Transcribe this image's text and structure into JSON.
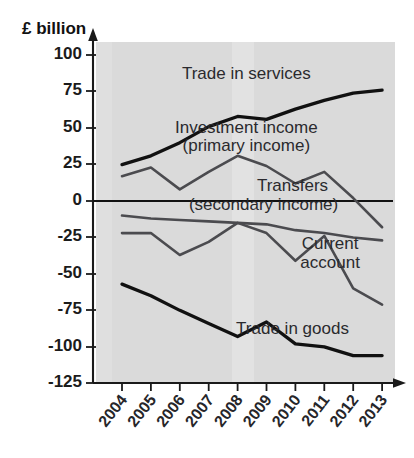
{
  "chart_data": {
    "type": "line",
    "title": "",
    "xlabel": "",
    "ylabel": "£ billion",
    "ylim": [
      -125,
      100
    ],
    "grid": false,
    "legend_position": "inline-annotations",
    "categories": [
      "2004",
      "2005",
      "2006",
      "2007",
      "2008",
      "2009",
      "2010",
      "2011",
      "2012",
      "2013"
    ],
    "yticks": [
      "100",
      "75",
      "50",
      "25",
      "0",
      "-25",
      "-50",
      "-75",
      "-100",
      "-125"
    ],
    "ytick_values": [
      100,
      75,
      50,
      25,
      0,
      -25,
      -50,
      -75,
      -100,
      -125
    ],
    "series": [
      {
        "name": "Trade in services",
        "style": "thick-black",
        "color": "#111111",
        "values": [
          25,
          31,
          40,
          51,
          58,
          56,
          63,
          69,
          74,
          76
        ]
      },
      {
        "name": "Investment income (primary income)",
        "style": "thin-grey",
        "color": "#4b4b4f",
        "values": [
          17,
          23,
          8,
          20,
          31,
          24,
          12,
          20,
          2,
          -18
        ]
      },
      {
        "name": "Transfers (secondary income)",
        "style": "thin-grey",
        "color": "#4b4b4f",
        "values": [
          -10,
          -12,
          -13,
          -14,
          -15,
          -16,
          -20,
          -22,
          -25,
          -27
        ]
      },
      {
        "name": "Current account",
        "style": "thin-grey",
        "color": "#4b4b4f",
        "values": [
          -22,
          -22,
          -37,
          -28,
          -15,
          -22,
          -41,
          -24,
          -60,
          -71
        ]
      },
      {
        "name": "Trade in goods",
        "style": "thick-black",
        "color": "#111111",
        "values": [
          -57,
          -65,
          -75,
          -84,
          -93,
          -83,
          -98,
          -100,
          -106,
          -106
        ]
      }
    ],
    "annotations": [
      {
        "text": "Trade in services",
        "x": 2008.3,
        "y": 84
      },
      {
        "text": "Investment income",
        "x": 2008.3,
        "y": 47
      },
      {
        "text": "(primary income)",
        "x": 2008.3,
        "y": 34
      },
      {
        "text": "Transfers",
        "x": 2009.9,
        "y": 7
      },
      {
        "text": "(secondary income)",
        "x": 2008.9,
        "y": -6
      },
      {
        "text": "Current",
        "x": 2011.2,
        "y": -33
      },
      {
        "text": "account",
        "x": 2011.2,
        "y": -46
      },
      {
        "text": "Trade in goods",
        "x": 2009.9,
        "y": -91
      }
    ]
  },
  "axis": {
    "y_title": "£ billion"
  }
}
